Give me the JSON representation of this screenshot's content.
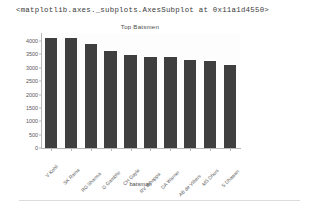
{
  "output_repr": "<matplotlib.axes._subplots.AxesSubplot at 0x11a1d4550>",
  "xlabel_text": "batsman",
  "colors": {
    "bar": "#3f3f3f",
    "axis": "#b8b8b8",
    "text": "#555555",
    "rule": "#dcdcdc"
  },
  "chart_data": {
    "type": "bar",
    "title": "Top Batsmen",
    "xlabel": "batsman",
    "ylabel": "",
    "categories": [
      "V Kohli",
      "SK Raina",
      "RG Sharma",
      "G Gambhir",
      "CH Gayle",
      "RV Uthappa",
      "DA Warner",
      "AB de Villiers",
      "MS Dhoni",
      "S Dhawan"
    ],
    "values": [
      4110,
      4105,
      3895,
      3634,
      3464,
      3403,
      3393,
      3283,
      3270,
      3114
    ],
    "ylim": [
      0,
      4300
    ],
    "yticks": [
      0,
      500,
      1000,
      1500,
      2000,
      2500,
      3000,
      3500,
      4000
    ],
    "ytick_labels": [
      "0",
      "500",
      "1000",
      "1500",
      "2000",
      "2500",
      "3000",
      "3500",
      "4000"
    ],
    "grid": false,
    "legend": null,
    "xtick_rotation": -45
  }
}
